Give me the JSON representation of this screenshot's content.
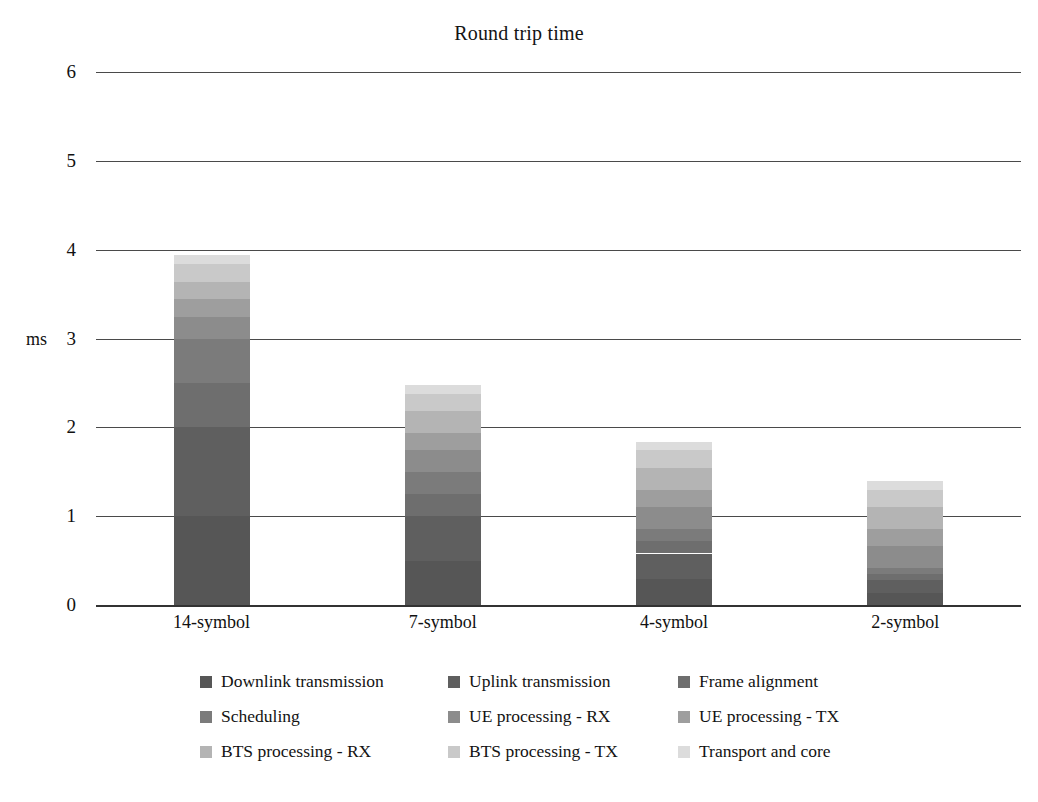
{
  "chart_data": {
    "type": "bar",
    "subtype": "stacked-bar",
    "title": "Round trip time",
    "xlabel": "",
    "ylabel": "ms",
    "ylim": [
      0,
      6
    ],
    "yticks": [
      0,
      1,
      2,
      3,
      4,
      5,
      6
    ],
    "ytick_labels": [
      "0",
      "1",
      "2",
      "3",
      "4",
      "5",
      "6"
    ],
    "grid": true,
    "legend_position": "bottom",
    "legend_columns": 3,
    "categories": [
      "14-symbol",
      "7-symbol",
      "4-symbol",
      "2-symbol"
    ],
    "series": [
      {
        "name": "Downlink transmission",
        "color": "#565656",
        "values": [
          1.0,
          0.5,
          0.29,
          0.14
        ]
      },
      {
        "name": "Uplink transmission",
        "color": "#5f5f5f",
        "values": [
          1.0,
          0.5,
          0.29,
          0.14
        ]
      },
      {
        "name": "Frame alignment",
        "color": "#6e6e6e",
        "values": [
          0.5,
          0.25,
          0.14,
          0.07
        ]
      },
      {
        "name": "Scheduling",
        "color": "#7b7b7b",
        "values": [
          0.5,
          0.25,
          0.14,
          0.07
        ]
      },
      {
        "name": "UE processing - RX",
        "color": "#8c8c8c",
        "values": [
          0.24,
          0.24,
          0.24,
          0.24
        ]
      },
      {
        "name": "UE processing - TX",
        "color": "#9e9e9e",
        "values": [
          0.2,
          0.2,
          0.2,
          0.2
        ]
      },
      {
        "name": "BTS processing - RX",
        "color": "#b4b4b4",
        "values": [
          0.2,
          0.24,
          0.24,
          0.24
        ]
      },
      {
        "name": "BTS processing - TX",
        "color": "#c9c9c9",
        "values": [
          0.2,
          0.2,
          0.2,
          0.2
        ]
      },
      {
        "name": "Transport and core",
        "color": "#dcdcdc",
        "values": [
          0.1,
          0.1,
          0.1,
          0.1
        ]
      }
    ],
    "totals": [
      3.94,
      2.48,
      1.84,
      1.4
    ],
    "colors": {
      "axis": "#4a4a4a",
      "text": "#111111",
      "background": "#ffffff"
    }
  }
}
